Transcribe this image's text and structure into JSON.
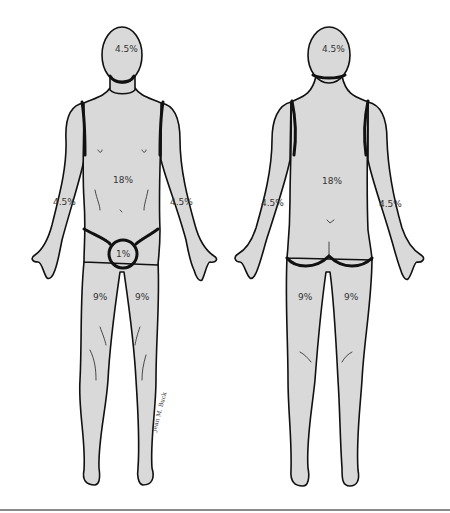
{
  "diagram": {
    "views": [
      {
        "name": "anterior",
        "regions": [
          {
            "region": "head",
            "label": "4.5%"
          },
          {
            "region": "trunk",
            "label": "18%"
          },
          {
            "region": "right-arm",
            "label": "4.5%"
          },
          {
            "region": "left-arm",
            "label": "4.5%"
          },
          {
            "region": "genitalia",
            "label": "1%"
          },
          {
            "region": "right-leg",
            "label": "9%"
          },
          {
            "region": "left-leg",
            "label": "9%"
          }
        ]
      },
      {
        "name": "posterior",
        "regions": [
          {
            "region": "head",
            "label": "4.5%"
          },
          {
            "region": "trunk",
            "label": "18%"
          },
          {
            "region": "left-arm",
            "label": "4.5%"
          },
          {
            "region": "right-arm",
            "label": "4.5%"
          },
          {
            "region": "left-leg",
            "label": "9%"
          },
          {
            "region": "right-leg",
            "label": "9%"
          }
        ]
      }
    ],
    "signature": "Jean M. Buck",
    "colors": {
      "skin": "#d9d9d9",
      "outline": "#111111",
      "background": "#ffffff",
      "rule": "#8a8a8a"
    }
  }
}
